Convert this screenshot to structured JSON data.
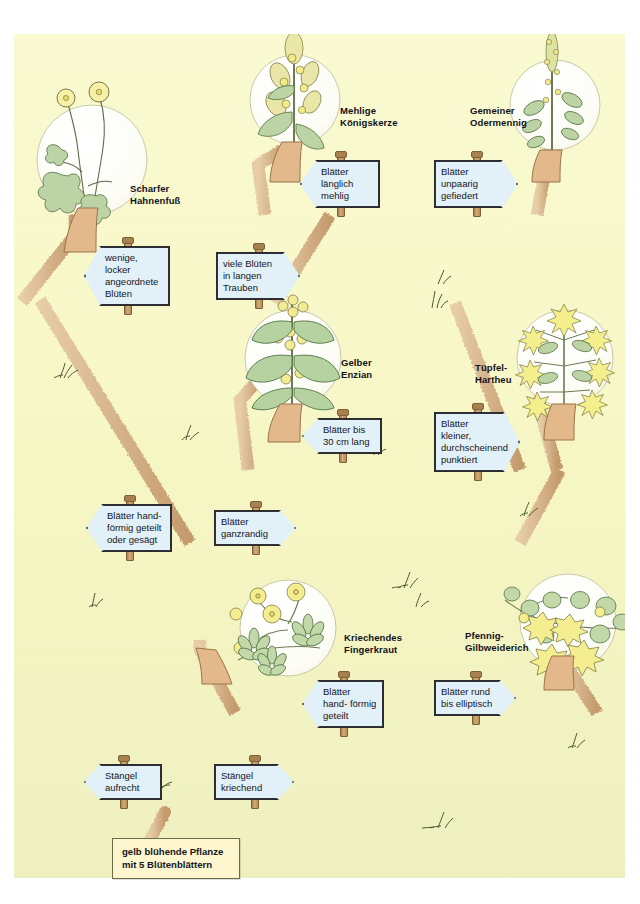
{
  "figure": {
    "kind": "dichotomous-identification-key",
    "background_color": "#f7f7c8",
    "path_color": "#d4b288",
    "sign_color": "#e2f0f7",
    "root_box_color": "#fdf6cf"
  },
  "root": {
    "text": "gelb blühende Pflanze\nmit 5 Blütenblättern"
  },
  "signs": [
    {
      "id": "staengel-aufrecht",
      "text": "Stängel\naufrecht",
      "direction": "left"
    },
    {
      "id": "staengel-kriechend",
      "text": "Stängel\nkriechend",
      "direction": "right"
    },
    {
      "id": "blaetter-handfoermig-gesaegt",
      "text": "Blätter hand-\nförmig geteilt\noder gesägt",
      "direction": "left"
    },
    {
      "id": "blaetter-ganzrandig",
      "text": "Blätter\nganzrandig",
      "direction": "right"
    },
    {
      "id": "wenige-blueten",
      "text": "wenige, locker\nangeordnete\nBlüten",
      "direction": "left"
    },
    {
      "id": "viele-blueten",
      "text": "viele Blüten in\nlangen Trauben",
      "direction": "right"
    },
    {
      "id": "blaetter-laenglich-mehlig",
      "text": "Blätter länglich\nmehlig",
      "direction": "left"
    },
    {
      "id": "blaetter-unpaarig-gefiedert",
      "text": "Blätter unpaarig\ngefiedert",
      "direction": "right"
    },
    {
      "id": "blaetter-bis-30cm",
      "text": "Blätter bis\n30 cm lang",
      "direction": "left"
    },
    {
      "id": "blaetter-kleiner-punktiert",
      "text": "Blätter kleiner,\ndurchscheinend\npunktiert",
      "direction": "right"
    },
    {
      "id": "blaetter-handfoermig-geteilt",
      "text": "Blätter hand-\nförmig geteilt",
      "direction": "left"
    },
    {
      "id": "blaetter-rund-elliptisch",
      "text": "Blätter rund\nbis elliptisch",
      "direction": "right"
    }
  ],
  "species": [
    {
      "id": "scharfer-hahnenfuss",
      "name": "Scharfer\nHahnenfuß"
    },
    {
      "id": "mehlige-koenigskerze",
      "name": "Mehlige\nKönigskerze"
    },
    {
      "id": "gemeiner-odermennig",
      "name": "Gemeiner\nOdermennig"
    },
    {
      "id": "gelber-enzian",
      "name": "Gelber\nEnzian"
    },
    {
      "id": "tuepfel-hartheu",
      "name": "Tüpfel-\nHartheu"
    },
    {
      "id": "kriechendes-fingerkraut",
      "name": "Kriechendes\nFingerkraut"
    },
    {
      "id": "pfennig-gilbweiderich",
      "name": "Pfennig-\nGilbweiderich"
    }
  ]
}
